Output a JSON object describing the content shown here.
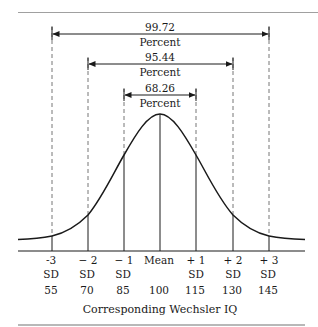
{
  "diagram": {
    "ranges": [
      {
        "value": "99.72",
        "unit": "Percent",
        "from_sd": "-3",
        "to_sd": "+3"
      },
      {
        "value": "95.44",
        "unit": "Percent",
        "from_sd": "-2",
        "to_sd": "+2"
      },
      {
        "value": "68.26",
        "unit": "Percent",
        "from_sd": "-1",
        "to_sd": "+1"
      }
    ],
    "ticks": [
      {
        "sd": "-3",
        "sd_label": "SD",
        "iq": "55"
      },
      {
        "sd": "− 2",
        "sd_label": "SD",
        "iq": "70"
      },
      {
        "sd": "− 1",
        "sd_label": "SD",
        "iq": "85"
      },
      {
        "sd": "Mean",
        "sd_label": "",
        "iq": "100"
      },
      {
        "sd": "+ 1",
        "sd_label": "SD",
        "iq": "115"
      },
      {
        "sd": "+ 2",
        "sd_label": "SD",
        "iq": "130"
      },
      {
        "sd": "+ 3",
        "sd_label": "SD",
        "iq": "145"
      }
    ],
    "caption": "Corresponding Wechsler IQ",
    "colors": {
      "ink": "#1a1a1a",
      "rule": "#9a9a9a",
      "dashed": "#777777"
    }
  }
}
